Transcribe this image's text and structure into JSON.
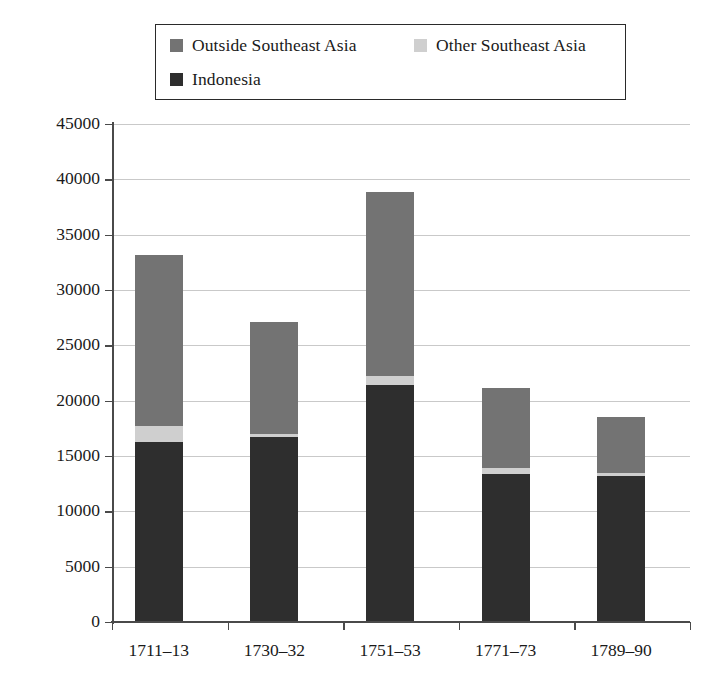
{
  "legend": {
    "entries": [
      {
        "label": "Outside Southeast Asia",
        "color": "#737373",
        "marker": "legend-swatch-outside-southeast-asia"
      },
      {
        "label": "Other Southeast Asia",
        "color": "#cfcfcf",
        "marker": "legend-swatch-other-southeast-asia"
      },
      {
        "label": "Indonesia",
        "color": "#2e2e2e",
        "marker": "legend-swatch-indonesia"
      }
    ]
  },
  "axes": {
    "y_ticks": [
      "0",
      "5000",
      "10000",
      "15000",
      "20000",
      "25000",
      "30000",
      "35000",
      "40000",
      "45000"
    ],
    "x_ticks": [
      "1711–13",
      "1730–32",
      "1751–53",
      "1771–73",
      "1789–90"
    ]
  },
  "chart_data": {
    "type": "bar",
    "title": "",
    "subtitle": "",
    "xlabel": "",
    "ylabel": "",
    "stacked": true,
    "grid": true,
    "legend_position": "top",
    "ylim": [
      0,
      45000
    ],
    "ytick_step": 5000,
    "categories": [
      "1711–13",
      "1730–32",
      "1751–53",
      "1771–73",
      "1789–90"
    ],
    "series": [
      {
        "name": "Indonesia",
        "color": "#2e2e2e",
        "values": [
          16300,
          16700,
          21400,
          13400,
          13200
        ]
      },
      {
        "name": "Other Southeast Asia",
        "color": "#cfcfcf",
        "values": [
          1400,
          300,
          800,
          500,
          300
        ]
      },
      {
        "name": "Outside Southeast Asia",
        "color": "#737373",
        "values": [
          15450,
          10100,
          16650,
          7250,
          5000
        ]
      }
    ],
    "totals": [
      33150,
      27100,
      38850,
      21150,
      18500
    ]
  }
}
